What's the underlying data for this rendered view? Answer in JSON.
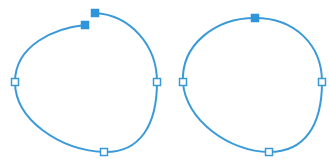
{
  "colors": {
    "stroke": "#3a9ad9",
    "anchor_fill": "#2f95db",
    "anchor_open_fill": "#ffffff",
    "background": "#ffffff"
  },
  "stroke_width": 2,
  "anchor_size": 7,
  "shapes": [
    {
      "name": "open-path",
      "closed": false,
      "path": "M 85 25 C 55 28, 15 45, 15 82 C 15 120, 60 150, 104 152 C 140 153, 157 125, 157 82 C 157 45, 130 15, 95 13",
      "anchors": [
        {
          "x": 85,
          "y": 25,
          "type": "selected"
        },
        {
          "x": 95,
          "y": 13,
          "type": "selected"
        },
        {
          "x": 15,
          "y": 82,
          "type": "open"
        },
        {
          "x": 157,
          "y": 82,
          "type": "open"
        },
        {
          "x": 104,
          "y": 152,
          "type": "open"
        }
      ]
    },
    {
      "name": "closed-path",
      "closed": true,
      "path": "M 255 18 C 295 18, 322 45, 322 82 C 322 125, 305 152, 269 152 C 230 152, 185 120, 183 82 C 181 45, 215 18, 255 18 Z",
      "anchors": [
        {
          "x": 255,
          "y": 18,
          "type": "selected"
        },
        {
          "x": 183,
          "y": 82,
          "type": "open"
        },
        {
          "x": 322,
          "y": 82,
          "type": "open"
        },
        {
          "x": 269,
          "y": 152,
          "type": "open"
        }
      ]
    }
  ]
}
